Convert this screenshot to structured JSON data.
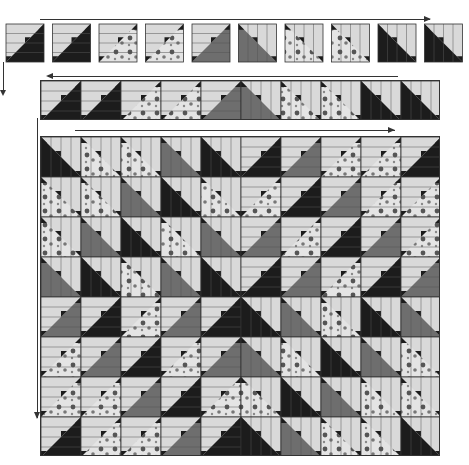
{
  "colors": {
    "black": "#1c1c1c",
    "gray": "#6e6e6e",
    "light": "#d9d9d9",
    "floral_bg": "#e4e4e4",
    "floral_spot": "#555555",
    "outline": "#333333"
  },
  "steps": [
    {
      "name": "row-of-10-blocks",
      "count": 10,
      "direction": "right"
    },
    {
      "name": "strip-row",
      "direction": "left"
    },
    {
      "name": "full-quilt",
      "direction": "right"
    }
  ],
  "blocks": [
    {
      "fill": "black",
      "orient": "a"
    },
    {
      "fill": "black",
      "orient": "a2"
    },
    {
      "fill": "floral",
      "orient": "a"
    },
    {
      "fill": "floral",
      "orient": "a2"
    },
    {
      "fill": "gray",
      "orient": "a"
    },
    {
      "fill": "gray",
      "orient": "b"
    },
    {
      "fill": "floral",
      "orient": "b"
    },
    {
      "fill": "floral",
      "orient": "b2"
    },
    {
      "fill": "black",
      "orient": "b"
    },
    {
      "fill": "black",
      "orient": "b2"
    }
  ]
}
